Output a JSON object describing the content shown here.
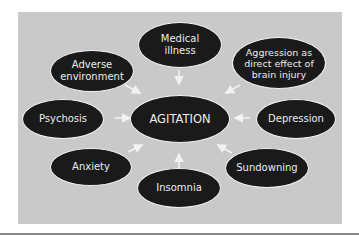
{
  "diagram": {
    "center": {
      "label": "AGITATION"
    },
    "causes": [
      {
        "id": "medical",
        "label": "Medical illness",
        "lines": [
          "Medical",
          "illness"
        ]
      },
      {
        "id": "adverse",
        "label": "Adverse environment",
        "lines": [
          "Adverse",
          "environment"
        ]
      },
      {
        "id": "aggression",
        "label": "Aggression as direct effect of brain injury",
        "lines": [
          "Aggression as",
          "direct effect of",
          "brain injury"
        ]
      },
      {
        "id": "psychosis",
        "label": "Psychosis",
        "lines": [
          "Psychosis"
        ]
      },
      {
        "id": "depression",
        "label": "Depression",
        "lines": [
          "Depression"
        ]
      },
      {
        "id": "anxiety",
        "label": "Anxiety",
        "lines": [
          "Anxiety"
        ]
      },
      {
        "id": "sundowning",
        "label": "Sundowning",
        "lines": [
          "Sundowning"
        ]
      },
      {
        "id": "insomnia",
        "label": "Insomnia",
        "lines": [
          "Insomnia"
        ]
      }
    ],
    "colors": {
      "background": "#c9c9c9",
      "node_fill": "#1a1a1a",
      "node_text": "#ececec",
      "arrow": "#f2f2f2"
    }
  }
}
